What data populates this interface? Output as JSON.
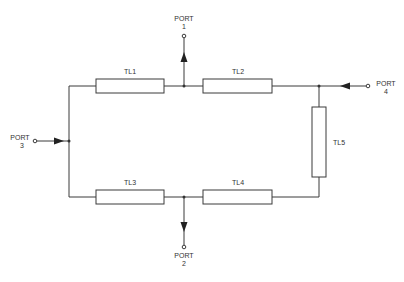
{
  "diagram": {
    "type": "rat-race / branch-line coupler schematic",
    "elements": [
      {
        "id": "TL1",
        "label": "TL1"
      },
      {
        "id": "TL2",
        "label": "TL2"
      },
      {
        "id": "TL3",
        "label": "TL3"
      },
      {
        "id": "TL4",
        "label": "TL4"
      },
      {
        "id": "TL5",
        "label": "TL5"
      }
    ],
    "ports": [
      {
        "id": "port1",
        "label": "PORT",
        "number": "1"
      },
      {
        "id": "port2",
        "label": "PORT",
        "number": "2"
      },
      {
        "id": "port3",
        "label": "PORT",
        "number": "3"
      },
      {
        "id": "port4",
        "label": "PORT",
        "number": "4"
      }
    ],
    "colors": {
      "line": "#3a3a3a",
      "background": "#ffffff",
      "text": "#333333"
    }
  }
}
